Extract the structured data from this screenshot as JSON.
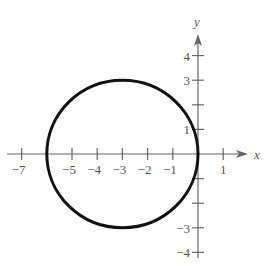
{
  "figure": {
    "circle": {
      "center": [
        -3,
        0
      ],
      "radius": 3,
      "stroke_color": "#111111"
    },
    "axis_color": "#666666",
    "x_axis": {
      "label": "x",
      "ticks": [
        -7,
        -6,
        -5,
        -4,
        -3,
        -2,
        -1,
        1
      ],
      "tick_labels": [
        {
          "value": -7,
          "text": "−7"
        },
        {
          "value": -5,
          "text": "−5"
        },
        {
          "value": -4,
          "text": "−4"
        },
        {
          "value": -3,
          "text": "−3"
        },
        {
          "value": -2,
          "text": "−2"
        },
        {
          "value": -1,
          "text": "−1"
        },
        {
          "value": 1,
          "text": "1"
        }
      ]
    },
    "y_axis": {
      "label": "y",
      "ticks": [
        -4,
        -3,
        -2,
        -1,
        1,
        2,
        3,
        4
      ],
      "tick_labels": [
        {
          "value": 4,
          "text": "4"
        },
        {
          "value": 3,
          "text": "3"
        },
        {
          "value": 1,
          "text": "1"
        },
        {
          "value": -3,
          "text": "−3"
        },
        {
          "value": -4,
          "text": "−4"
        }
      ]
    }
  }
}
